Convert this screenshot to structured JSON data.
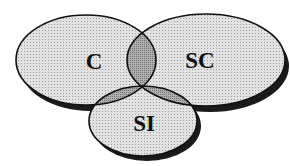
{
  "diagram": {
    "type": "venn",
    "sets": [
      {
        "id": "c",
        "label": "C",
        "cx": 86,
        "cy": 60,
        "rx": 70,
        "ry": 45
      },
      {
        "id": "sc",
        "label": "SC",
        "cx": 206,
        "cy": 60,
        "rx": 79,
        "ry": 46
      },
      {
        "id": "si",
        "label": "SI",
        "cx": 143,
        "cy": 121,
        "rx": 54,
        "ry": 35
      }
    ],
    "colors": {
      "fill": "#d6d6d6",
      "overlap": "#9a9a9a",
      "stroke": "#111111",
      "shadow": "#1a1a1a",
      "background": "#ffffff"
    }
  }
}
